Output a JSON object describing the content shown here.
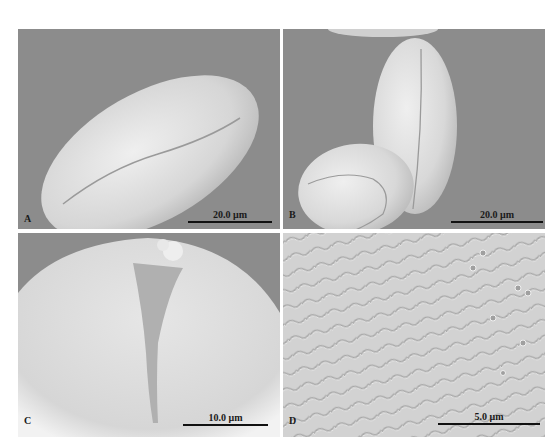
{
  "figure": {
    "type": "SEM micrograph plate",
    "panels": [
      {
        "label": "A",
        "scale_bar": "20.0 μm",
        "content": "single elongated ellipsoidal pollen grain, oblique view, with long colpus"
      },
      {
        "label": "B",
        "scale_bar": "20.0 μm",
        "content": "two pollen grains, one upright ellipsoid with colpus, one in polar/oblique view"
      },
      {
        "label": "C",
        "scale_bar": "10.0 μm",
        "content": "close-up of grain apex showing colpus and rugulate/perforate surface"
      },
      {
        "label": "D",
        "scale_bar": "5.0 μm",
        "content": "detail of exine ornamentation, rugulate with perforations"
      }
    ]
  },
  "colors": {
    "background": "#8a8a8a",
    "grain": "#d8d8d8",
    "grain_highlight": "#efefef",
    "text": "#1a1a1a"
  }
}
